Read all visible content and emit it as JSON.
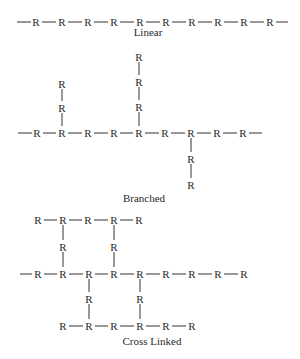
{
  "diagram": {
    "atom_label": "R",
    "colors": {
      "ink": "#2a2a2a",
      "bond": "#333333",
      "background": "#ffffff"
    }
  },
  "structures": [
    {
      "id": "linear",
      "caption": "Linear",
      "caption_pos": [
        148,
        36
      ],
      "atoms": [
        [
          36,
          22
        ],
        [
          62,
          22
        ],
        [
          88,
          22
        ],
        [
          114,
          22
        ],
        [
          140,
          22
        ],
        [
          166,
          22
        ],
        [
          192,
          22
        ],
        [
          218,
          22
        ],
        [
          244,
          22
        ],
        [
          270,
          22
        ]
      ],
      "bonds": [
        [
          [
            17,
            22
          ],
          [
            31,
            22
          ]
        ],
        [
          [
            42,
            22
          ],
          [
            56,
            22
          ]
        ],
        [
          [
            68,
            22
          ],
          [
            82,
            22
          ]
        ],
        [
          [
            94,
            22
          ],
          [
            108,
            22
          ]
        ],
        [
          [
            120,
            22
          ],
          [
            134,
            22
          ]
        ],
        [
          [
            146,
            22
          ],
          [
            160,
            22
          ]
        ],
        [
          [
            172,
            22
          ],
          [
            186,
            22
          ]
        ],
        [
          [
            198,
            22
          ],
          [
            212,
            22
          ]
        ],
        [
          [
            224,
            22
          ],
          [
            238,
            22
          ]
        ],
        [
          [
            250,
            22
          ],
          [
            264,
            22
          ]
        ],
        [
          [
            276,
            22
          ],
          [
            288,
            22
          ]
        ]
      ]
    },
    {
      "id": "branched",
      "caption": "Branched",
      "caption_pos": [
        144,
        202
      ],
      "atoms": [
        [
          37,
          133
        ],
        [
          62,
          133
        ],
        [
          88,
          133
        ],
        [
          114,
          133
        ],
        [
          139,
          133
        ],
        [
          165,
          133
        ],
        [
          191,
          133
        ],
        [
          217,
          133
        ],
        [
          243,
          133
        ],
        [
          62,
          84
        ],
        [
          62,
          108
        ],
        [
          139,
          57
        ],
        [
          139,
          82
        ],
        [
          139,
          107
        ],
        [
          191,
          159
        ],
        [
          191,
          185
        ]
      ],
      "bonds": [
        [
          [
            18,
            133
          ],
          [
            32,
            133
          ]
        ],
        [
          [
            43,
            133
          ],
          [
            56,
            133
          ]
        ],
        [
          [
            68,
            133
          ],
          [
            82,
            133
          ]
        ],
        [
          [
            94,
            133
          ],
          [
            108,
            133
          ]
        ],
        [
          [
            120,
            133
          ],
          [
            133,
            133
          ]
        ],
        [
          [
            145,
            133
          ],
          [
            159,
            133
          ]
        ],
        [
          [
            171,
            133
          ],
          [
            185,
            133
          ]
        ],
        [
          [
            197,
            133
          ],
          [
            211,
            133
          ]
        ],
        [
          [
            223,
            133
          ],
          [
            237,
            133
          ]
        ],
        [
          [
            249,
            133
          ],
          [
            262,
            133
          ]
        ],
        [
          [
            62,
            89
          ],
          [
            62,
            101
          ]
        ],
        [
          [
            62,
            113
          ],
          [
            62,
            126
          ]
        ],
        [
          [
            139,
            62
          ],
          [
            139,
            75
          ]
        ],
        [
          [
            139,
            87
          ],
          [
            139,
            100
          ]
        ],
        [
          [
            139,
            112
          ],
          [
            139,
            126
          ]
        ],
        [
          [
            191,
            138
          ],
          [
            191,
            152
          ]
        ],
        [
          [
            191,
            164
          ],
          [
            191,
            178
          ]
        ]
      ]
    },
    {
      "id": "cross-linked",
      "caption": "Cross Linked",
      "caption_pos": [
        152,
        345
      ],
      "atoms": [
        [
          38,
          220
        ],
        [
          63,
          220
        ],
        [
          88,
          220
        ],
        [
          114,
          220
        ],
        [
          139,
          220
        ],
        [
          63,
          247
        ],
        [
          114,
          247
        ],
        [
          38,
          274
        ],
        [
          63,
          274
        ],
        [
          89,
          274
        ],
        [
          114,
          274
        ],
        [
          140,
          274
        ],
        [
          166,
          274
        ],
        [
          192,
          274
        ],
        [
          218,
          274
        ],
        [
          244,
          274
        ],
        [
          89,
          299
        ],
        [
          140,
          299
        ],
        [
          63,
          326
        ],
        [
          89,
          326
        ],
        [
          114,
          326
        ],
        [
          140,
          326
        ],
        [
          166,
          326
        ],
        [
          192,
          326
        ]
      ],
      "bonds": [
        [
          [
            44,
            220
          ],
          [
            57,
            220
          ]
        ],
        [
          [
            69,
            220
          ],
          [
            82,
            220
          ]
        ],
        [
          [
            94,
            220
          ],
          [
            108,
            220
          ]
        ],
        [
          [
            120,
            220
          ],
          [
            133,
            220
          ]
        ],
        [
          [
            63,
            225
          ],
          [
            63,
            240
          ]
        ],
        [
          [
            63,
            252
          ],
          [
            63,
            267
          ]
        ],
        [
          [
            114,
            225
          ],
          [
            114,
            240
          ]
        ],
        [
          [
            114,
            252
          ],
          [
            114,
            267
          ]
        ],
        [
          [
            20,
            274
          ],
          [
            32,
            274
          ]
        ],
        [
          [
            44,
            274
          ],
          [
            57,
            274
          ]
        ],
        [
          [
            69,
            274
          ],
          [
            83,
            274
          ]
        ],
        [
          [
            95,
            274
          ],
          [
            108,
            274
          ]
        ],
        [
          [
            120,
            274
          ],
          [
            134,
            274
          ]
        ],
        [
          [
            146,
            274
          ],
          [
            160,
            274
          ]
        ],
        [
          [
            172,
            274
          ],
          [
            186,
            274
          ]
        ],
        [
          [
            198,
            274
          ],
          [
            212,
            274
          ]
        ],
        [
          [
            224,
            274
          ],
          [
            238,
            274
          ]
        ],
        [
          [
            89,
            279
          ],
          [
            89,
            292
          ]
        ],
        [
          [
            89,
            304
          ],
          [
            89,
            319
          ]
        ],
        [
          [
            140,
            279
          ],
          [
            140,
            292
          ]
        ],
        [
          [
            140,
            304
          ],
          [
            140,
            319
          ]
        ],
        [
          [
            69,
            326
          ],
          [
            83,
            326
          ]
        ],
        [
          [
            95,
            326
          ],
          [
            108,
            326
          ]
        ],
        [
          [
            120,
            326
          ],
          [
            134,
            326
          ]
        ],
        [
          [
            146,
            326
          ],
          [
            160,
            326
          ]
        ],
        [
          [
            172,
            326
          ],
          [
            186,
            326
          ]
        ]
      ]
    }
  ]
}
